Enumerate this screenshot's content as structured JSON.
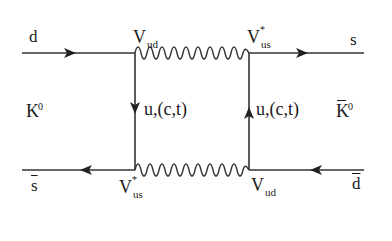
{
  "diagram": {
    "type": "feynman-box-diagram",
    "external_lines": {
      "top_left": {
        "label": "d",
        "direction": "right"
      },
      "top_right": {
        "label": "s",
        "direction": "right"
      },
      "bottom_left": {
        "label": "s",
        "overline": true,
        "direction": "left"
      },
      "bottom_right": {
        "label": "d",
        "overline": true,
        "direction": "left"
      }
    },
    "mesons": {
      "left": {
        "base": "K",
        "superscript": "0"
      },
      "right": {
        "base": "K",
        "superscript": "0",
        "overline": true
      }
    },
    "vertices": {
      "top_left": {
        "base": "V",
        "subscript": "ud",
        "conjugate": false
      },
      "top_right": {
        "base": "V",
        "subscript": "us",
        "conjugate": true
      },
      "bottom_left": {
        "base": "V",
        "subscript": "us",
        "conjugate": true
      },
      "bottom_right": {
        "base": "V",
        "subscript": "ud",
        "conjugate": false
      }
    },
    "internal_quarks": {
      "left": {
        "label": "u,(c,t)",
        "direction": "down"
      },
      "right": {
        "label": "u,(c,t)",
        "direction": "up"
      }
    },
    "boson_lines": {
      "top": {
        "style": "wavy"
      },
      "bottom": {
        "style": "wavy"
      }
    },
    "colors": {
      "line": "#333333",
      "text": "#1a1a1a",
      "background": "#ffffff"
    }
  }
}
